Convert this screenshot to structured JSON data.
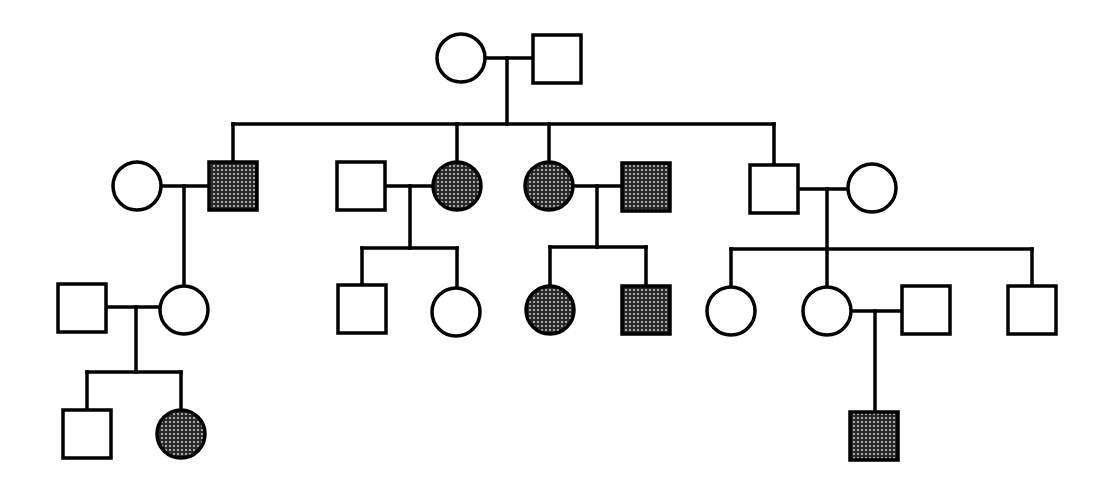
{
  "diagram": {
    "type": "pedigree",
    "colors": {
      "stroke": "#000000",
      "unaffected_fill": "#ffffff",
      "affected_fill": "#3a3a3a",
      "affected_dot": "#bdbdbd"
    },
    "individuals": [
      {
        "id": "I-1",
        "sex": "female",
        "affected": false,
        "x": 461,
        "y": 58
      },
      {
        "id": "I-2",
        "sex": "male",
        "affected": false,
        "x": 557,
        "y": 59
      },
      {
        "id": "II-1",
        "sex": "female",
        "affected": false,
        "x": 137,
        "y": 186
      },
      {
        "id": "II-2",
        "sex": "male",
        "affected": true,
        "x": 233,
        "y": 186
      },
      {
        "id": "II-3",
        "sex": "male",
        "affected": false,
        "x": 361,
        "y": 186
      },
      {
        "id": "II-4",
        "sex": "female",
        "affected": true,
        "x": 457,
        "y": 186
      },
      {
        "id": "II-5",
        "sex": "female",
        "affected": true,
        "x": 549,
        "y": 186
      },
      {
        "id": "II-6",
        "sex": "male",
        "affected": true,
        "x": 646,
        "y": 187
      },
      {
        "id": "II-7",
        "sex": "male",
        "affected": false,
        "x": 774,
        "y": 189
      },
      {
        "id": "II-8",
        "sex": "female",
        "affected": false,
        "x": 872,
        "y": 188
      },
      {
        "id": "III-1",
        "sex": "male",
        "affected": false,
        "x": 82,
        "y": 308
      },
      {
        "id": "III-2",
        "sex": "female",
        "affected": false,
        "x": 184,
        "y": 310
      },
      {
        "id": "III-3",
        "sex": "male",
        "affected": false,
        "x": 362,
        "y": 309
      },
      {
        "id": "III-4",
        "sex": "female",
        "affected": false,
        "x": 456,
        "y": 312
      },
      {
        "id": "III-5",
        "sex": "female",
        "affected": true,
        "x": 550,
        "y": 310
      },
      {
        "id": "III-6",
        "sex": "male",
        "affected": true,
        "x": 646,
        "y": 310
      },
      {
        "id": "III-7",
        "sex": "female",
        "affected": false,
        "x": 731,
        "y": 311
      },
      {
        "id": "III-8",
        "sex": "female",
        "affected": false,
        "x": 827,
        "y": 311
      },
      {
        "id": "III-9",
        "sex": "male",
        "affected": false,
        "x": 926,
        "y": 310
      },
      {
        "id": "III-10",
        "sex": "male",
        "affected": false,
        "x": 1032,
        "y": 310
      },
      {
        "id": "IV-1",
        "sex": "male",
        "affected": false,
        "x": 87,
        "y": 434
      },
      {
        "id": "IV-2",
        "sex": "female",
        "affected": true,
        "x": 181,
        "y": 434
      },
      {
        "id": "IV-3",
        "sex": "male",
        "affected": true,
        "x": 874,
        "y": 436
      }
    ],
    "lines": [
      [
        486,
        58,
        532,
        58
      ],
      [
        507,
        58,
        507,
        124
      ],
      [
        233,
        124,
        774,
        124
      ],
      [
        233,
        124,
        233,
        162
      ],
      [
        457,
        124,
        457,
        161
      ],
      [
        549,
        124,
        549,
        161
      ],
      [
        774,
        124,
        774,
        164
      ],
      [
        161,
        186,
        208,
        186
      ],
      [
        184,
        186,
        184,
        285
      ],
      [
        385,
        186,
        432,
        186
      ],
      [
        410,
        186,
        410,
        248
      ],
      [
        362,
        248,
        457,
        248
      ],
      [
        362,
        248,
        362,
        285
      ],
      [
        457,
        248,
        457,
        287
      ],
      [
        574,
        186,
        621,
        186
      ],
      [
        597,
        186,
        597,
        247
      ],
      [
        550,
        247,
        646,
        247
      ],
      [
        550,
        247,
        550,
        285
      ],
      [
        646,
        247,
        646,
        285
      ],
      [
        799,
        189,
        848,
        189
      ],
      [
        827,
        189,
        827,
        249
      ],
      [
        731,
        249,
        1032,
        249
      ],
      [
        731,
        249,
        731,
        286
      ],
      [
        827,
        249,
        827,
        286
      ],
      [
        1032,
        249,
        1032,
        285
      ],
      [
        107,
        307,
        160,
        307
      ],
      [
        136,
        307,
        136,
        372
      ],
      [
        87,
        372,
        181,
        372
      ],
      [
        87,
        372,
        87,
        410
      ],
      [
        181,
        372,
        181,
        409
      ],
      [
        852,
        311,
        902,
        311
      ],
      [
        875,
        311,
        875,
        411
      ]
    ]
  }
}
